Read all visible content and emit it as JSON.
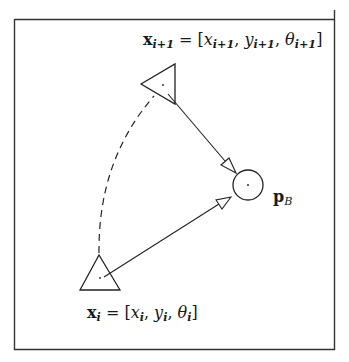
{
  "diagram": {
    "frame": {
      "stroke": "#333333"
    },
    "labels": {
      "next_pose": {
        "var": "x",
        "var_sub": "i+1",
        "eq": " = [",
        "x": "x",
        "x_sub": "i+1",
        "y": "y",
        "y_sub": "i+1",
        "theta": "θ",
        "theta_sub": "i+1",
        "close": "]",
        "sep": ", "
      },
      "current_pose": {
        "var": "x",
        "var_sub": "i",
        "eq": " = [",
        "x": "x",
        "x_sub": "i",
        "y": "y",
        "y_sub": "i",
        "theta": "θ",
        "theta_sub": "i",
        "close": "]",
        "sep": ", "
      },
      "target": {
        "var": "p",
        "var_sub": "B"
      }
    },
    "nodes": [
      {
        "id": "robot-next",
        "shape": "triangle",
        "center": [
          163,
          85
        ]
      },
      {
        "id": "robot-current",
        "shape": "triangle",
        "center": [
          100,
          278
        ]
      },
      {
        "id": "target-point",
        "shape": "circle",
        "center": [
          248,
          185
        ],
        "radius": 15
      }
    ],
    "edges": [
      {
        "from": "robot-next",
        "to": "target-point",
        "style": "solid-arrow"
      },
      {
        "from": "robot-current",
        "to": "target-point",
        "style": "solid-arrow"
      },
      {
        "from": "robot-current",
        "to": "robot-next",
        "style": "dashed-arc"
      }
    ]
  }
}
